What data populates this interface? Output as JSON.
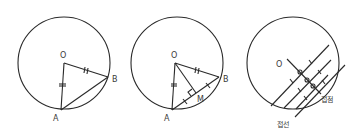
{
  "diagrams": [
    {
      "name": "isosceles-triangle-OAB",
      "labels": {
        "center": "O",
        "point_a": "A",
        "point_b": "B"
      },
      "marks": [
        "OA = OB (equal-length tick marks)"
      ]
    },
    {
      "name": "perpendicular-from-center-to-chord",
      "labels": {
        "center": "O",
        "point_a": "A",
        "point_b": "B",
        "midpoint": "M"
      },
      "marks": [
        "OA = OB",
        "AM = MB",
        "OM ⊥ AB (right angle at M)"
      ]
    },
    {
      "name": "parallel-chords-to-tangent",
      "labels": {
        "center": "O",
        "tangent_point": "접점",
        "tangent_line": "접선"
      },
      "marks": [
        "parallel chords bisected by line through O",
        "right angles at intersections"
      ]
    }
  ]
}
